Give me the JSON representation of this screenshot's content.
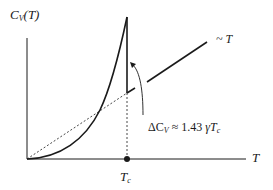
{
  "diagram": {
    "y_axis_label": "C",
    "y_axis_label_sub": "V",
    "y_axis_label_arg": "(T)",
    "x_axis_label": "T",
    "critical_temp_label": "T",
    "critical_temp_sub": "c",
    "linear_label": "~ T",
    "jump_annotation": {
      "prefix": "ΔC",
      "prefix_sub": "V",
      "relation": " ≈ 1.43 ",
      "gamma": "γ",
      "tc": "T",
      "tc_sub": "c"
    },
    "colors": {
      "curve": "#1a1a1a",
      "axes": "#1a1a1a",
      "dashed": "#333333"
    }
  }
}
